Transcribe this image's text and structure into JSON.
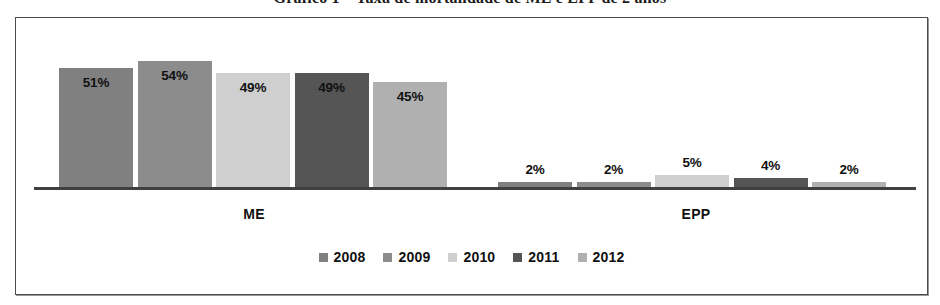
{
  "figure": {
    "title": "Gráfico 1 – Taxa de mortalidade de ME e EPP de 2 anos"
  },
  "chart_data": {
    "type": "bar",
    "title": "Gráfico 1 – Taxa de mortalidade de ME e EPP de 2 anos",
    "xlabel": "",
    "ylabel": "",
    "ylim": [
      0,
      60
    ],
    "grid": false,
    "legend_position": "bottom",
    "categories": [
      "ME",
      "EPP"
    ],
    "series": [
      {
        "name": "2008",
        "color": "#808080",
        "values": [
          51,
          2
        ],
        "labels": [
          "51%",
          "2%"
        ]
      },
      {
        "name": "2009",
        "color": "#8c8c8c",
        "values": [
          54,
          2
        ],
        "labels": [
          "54%",
          "2%"
        ]
      },
      {
        "name": "2010",
        "color": "#cfcfcf",
        "values": [
          49,
          5
        ],
        "labels": [
          "49%",
          "5%"
        ]
      },
      {
        "name": "2011",
        "color": "#555555",
        "values": [
          49,
          4
        ],
        "labels": [
          "49%",
          "4%"
        ]
      },
      {
        "name": "2012",
        "color": "#b0b0b0",
        "values": [
          45,
          2
        ],
        "labels": [
          "45%",
          "2%"
        ]
      }
    ]
  },
  "legend": {
    "items": [
      {
        "label": "2008",
        "color": "#808080"
      },
      {
        "label": "2009",
        "color": "#8c8c8c"
      },
      {
        "label": "2010",
        "color": "#cfcfcf"
      },
      {
        "label": "2011",
        "color": "#555555"
      },
      {
        "label": "2012",
        "color": "#b0b0b0"
      }
    ]
  }
}
